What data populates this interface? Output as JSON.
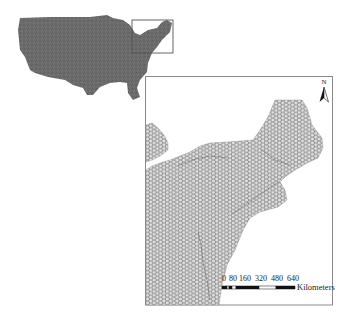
{
  "figure": {
    "overview_map": {
      "fill_color": "#6b6b6b",
      "extent_box_color": "#555555"
    },
    "inset_map": {
      "frame_color": "#8a8a8a",
      "hex_grid_stroke": "#707070",
      "hex_grid_fill": "#e2e2e2",
      "internal_line_color": "#4a4a4a"
    },
    "north_arrow": {
      "label": "N",
      "icon": "north-arrow-icon"
    },
    "scale_bar": {
      "ticks": [
        "0",
        "80",
        "160",
        "320",
        "480",
        "640"
      ],
      "unit": "Kilometers",
      "segment_colors": [
        "#111111",
        "#ffffff",
        "#111111",
        "#ffffff",
        "#111111",
        "#ffffff",
        "#111111"
      ]
    }
  }
}
